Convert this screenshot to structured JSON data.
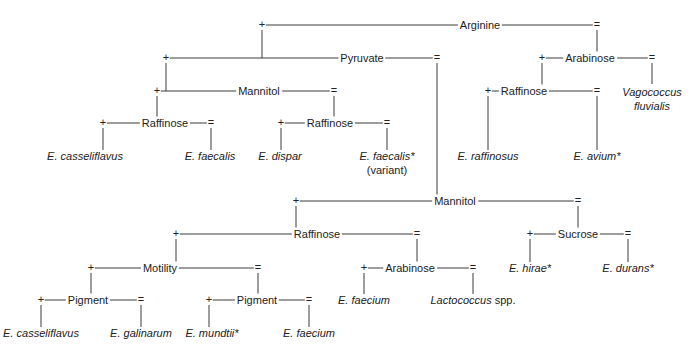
{
  "diagram": {
    "type": "identification-flowchart",
    "legend": {
      "plus": "+",
      "minus": "="
    },
    "tests": {
      "arginine": "Arginine",
      "pyruvate": "Pyruvate",
      "arabinose_top": "Arabinose",
      "mannitol_left": "Mannitol",
      "raffinose_right_top": "Raffinose",
      "raffinose_left": "Raffinose",
      "raffinose_mid": "Raffinose",
      "mannitol_lower": "Mannitol",
      "raffinose_lower": "Raffinose",
      "sucrose": "Sucrose",
      "motility": "Motility",
      "arabinose_lower": "Arabinose",
      "pigment_left": "Pigment",
      "pigment_right": "Pigment"
    },
    "species": {
      "casseliflavus_1": "E. casseliflavus",
      "faecalis": "E. faecalis",
      "dispar": "E. dispar",
      "faecalis_variant": "E. faecalis*",
      "variant_note": "(variant)",
      "raffinosus": "E. raffinosus",
      "avium": "E. avium*",
      "vagococcus_1": "Vagococcus",
      "vagococcus_2": "fluvialis",
      "hirae": "E. hirae*",
      "durans": "E. durans*",
      "faecium_1": "E. faecium",
      "lactococcus": "Lactococcus",
      "lactococcus_suffix": " spp.",
      "casseliflavus_2": "E. casseliflavus",
      "galinarum": "E. galinarum",
      "mundtii": "E. mundtii*",
      "faecium_2": "E. faecium"
    }
  }
}
